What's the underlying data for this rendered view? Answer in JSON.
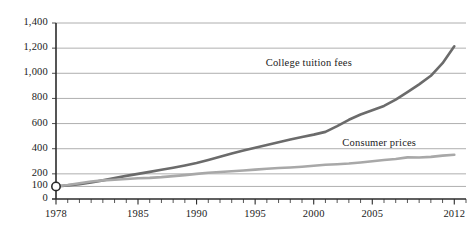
{
  "chart_data": {
    "type": "line",
    "title": "",
    "subtitle": "",
    "xlabel": "",
    "ylabel": "",
    "xlim": [
      1978,
      2013
    ],
    "ylim": [
      0,
      1400
    ],
    "grid": true,
    "legend_position": "inline-annotations",
    "index_note": "1978 = 100",
    "y_ticks": [
      0,
      100,
      200,
      400,
      600,
      800,
      1000,
      1200,
      1400
    ],
    "y_tick_labels": [
      "0",
      "100",
      "200",
      "400",
      "600",
      "800",
      "1,000",
      "1,200",
      "1,400"
    ],
    "x_ticks": [
      1978,
      1985,
      1990,
      1995,
      2000,
      2005,
      2012
    ],
    "x_tick_labels": [
      "1978",
      "1985",
      "1990",
      "1995",
      "2000",
      "2005",
      "2012"
    ],
    "x_minor_tick_step": 1,
    "origin_marker": {
      "x": 1978,
      "y": 100,
      "shape": "circle-open"
    },
    "series": [
      {
        "name": "College tuition fees",
        "color": "#6b6b6b",
        "width": 2.6,
        "label_x": 2000,
        "label_y": 1075,
        "x": [
          1978,
          1979,
          1980,
          1981,
          1982,
          1983,
          1984,
          1985,
          1986,
          1987,
          1988,
          1989,
          1990,
          1991,
          1992,
          1993,
          1994,
          1995,
          1996,
          1997,
          1998,
          1999,
          2000,
          2001,
          2002,
          2003,
          2004,
          2005,
          2006,
          2007,
          2008,
          2009,
          2010,
          2011,
          2012
        ],
        "values": [
          100,
          108,
          118,
          131,
          148,
          167,
          184,
          200,
          216,
          232,
          248,
          266,
          286,
          310,
          336,
          362,
          386,
          408,
          430,
          452,
          474,
          494,
          512,
          534,
          580,
          630,
          672,
          706,
          740,
          790,
          850,
          912,
          980,
          1080,
          1215
        ]
      },
      {
        "name": "Consumer prices",
        "color": "#a8a8a8",
        "width": 2.6,
        "label_x": 2005,
        "label_y": 435,
        "x": [
          1978,
          1979,
          1980,
          1981,
          1982,
          1983,
          1984,
          1985,
          1986,
          1987,
          1988,
          1989,
          1990,
          1991,
          1992,
          1993,
          1994,
          1995,
          1996,
          1997,
          1998,
          1999,
          2000,
          2001,
          2002,
          2003,
          2004,
          2005,
          2006,
          2007,
          2008,
          2009,
          2010,
          2011,
          2012
        ],
        "values": [
          100,
          111,
          126,
          139,
          148,
          153,
          159,
          165,
          168,
          174,
          182,
          190,
          200,
          209,
          215,
          221,
          227,
          234,
          241,
          246,
          250,
          256,
          264,
          272,
          276,
          282,
          290,
          300,
          310,
          318,
          331,
          330,
          335,
          345,
          352
        ]
      }
    ]
  },
  "axis": {
    "y_axis_name": "y-axis",
    "x_axis_name": "x-axis"
  }
}
